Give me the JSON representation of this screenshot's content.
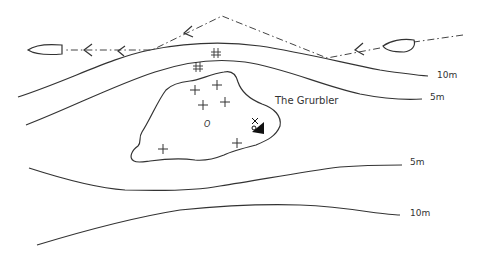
{
  "map": {
    "feature_name": "The Grurbler",
    "contours": [
      {
        "id": "north-10m",
        "label": "10m"
      },
      {
        "id": "north-5m",
        "label": "5m"
      },
      {
        "id": "south-5m",
        "label": "5m"
      },
      {
        "id": "south-10m",
        "label": "10m"
      }
    ],
    "obstruction_label": "O",
    "symbols": {
      "rock": "+",
      "rock_awash": "⁜",
      "wreck": "wreck-symbol",
      "boat": "boat-outline",
      "route": "dash-dot-route-with-arrows"
    },
    "colors": {
      "ink": "#333333",
      "background": "#ffffff"
    }
  }
}
